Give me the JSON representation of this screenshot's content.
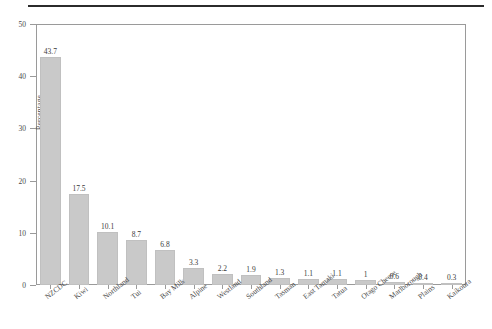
{
  "figure": {
    "rule_label": "top-horizontal-rule"
  },
  "axes": {
    "ylabel": "Percentage",
    "yticks": [
      "0",
      "10",
      "20",
      "30",
      "40",
      "50"
    ],
    "xlabel": ""
  },
  "chart_data": {
    "type": "bar",
    "title": "",
    "subtitle": "",
    "xlabel": "",
    "ylabel": "Percentage",
    "ylim": [
      0,
      50
    ],
    "ytick_values": [
      0,
      10,
      20,
      30,
      40,
      50
    ],
    "grid": false,
    "legend": false,
    "bar_color": "#c9c9c9",
    "categories": [
      "NZCDC",
      "Kiwi",
      "Northland",
      "Tui",
      "Bay Milk",
      "Alpine",
      "Westland",
      "Southland",
      "Tasman",
      "East Tamaki",
      "Tatua",
      "Otago Cheese",
      "Marlborough",
      "Plains",
      "Kaikoura"
    ],
    "values": [
      43.7,
      17.5,
      10.1,
      8.7,
      6.8,
      3.3,
      2.2,
      1.9,
      1.3,
      1.1,
      1.1,
      1,
      0.6,
      0.4,
      0.3
    ],
    "value_labels": [
      "43.7",
      "17.5",
      "10.1",
      "8.7",
      "6.8",
      "3.3",
      "2.2",
      "1.9",
      "1.3",
      "1.1",
      "1.1",
      "1",
      "0.6",
      "0.4",
      "0.3"
    ]
  }
}
